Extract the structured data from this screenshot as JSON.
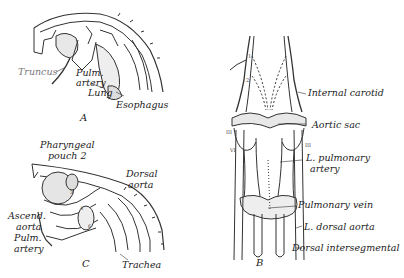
{
  "figure": {
    "panels": [
      {
        "id": "A",
        "label": "A",
        "annotations": [
          "Truncus",
          "Pulm.",
          "artery",
          "Lung",
          "Esophagus"
        ]
      },
      {
        "id": "B",
        "label": "B",
        "annotations": [
          "Internal carotid",
          "Aortic sac",
          "L. pulmonary",
          "artery",
          "Pulmonary vein",
          "L. dorsal aorta",
          "Dorsal intersegmental"
        ],
        "arch_numerals": [
          "1",
          "2",
          "III",
          "IV",
          "VI",
          "VI",
          "III"
        ]
      },
      {
        "id": "C",
        "label": "C",
        "annotations": [
          "Pharyngeal",
          "pouch 2",
          "Dorsal",
          "aorta",
          "Ascend.",
          "aorta",
          "Pulm.",
          "artery",
          "Trachea"
        ],
        "arch_numerals": [
          "3",
          "4",
          "6"
        ]
      }
    ]
  }
}
